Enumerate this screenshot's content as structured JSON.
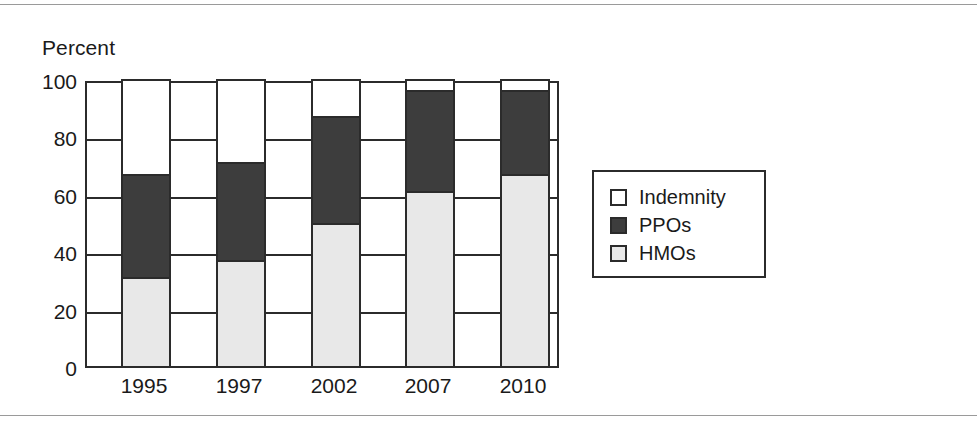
{
  "figure": {
    "axis_title": "Percent"
  },
  "chart_data": {
    "type": "bar",
    "subtype": "stacked-bar-100",
    "title": "",
    "xlabel": "",
    "ylabel": "Percent",
    "ylim": [
      0,
      100
    ],
    "yticks": [
      0,
      20,
      40,
      60,
      80,
      100
    ],
    "ytick_labels": [
      "0",
      "20",
      "40",
      "60",
      "80",
      "100"
    ],
    "grid": true,
    "grid_axis": "y",
    "legend_position": "right",
    "categories": [
      "1995",
      "1997",
      "2002",
      "2007",
      "2010"
    ],
    "series": [
      {
        "name": "HMOs",
        "color": "#e8e8e8",
        "values": [
          31,
          37,
          50,
          61,
          67
        ]
      },
      {
        "name": "PPOs",
        "color": "#3d3d3d",
        "values": [
          36,
          34,
          37,
          35,
          29
        ]
      },
      {
        "name": "Indemnity",
        "color": "#ffffff",
        "values": [
          33,
          29,
          13,
          4,
          4
        ]
      }
    ],
    "cumulative_tops": {
      "hmo": [
        31,
        37,
        50,
        61,
        67
      ],
      "ppo": [
        67,
        71,
        87,
        96,
        96
      ],
      "indemnity": [
        100,
        100,
        100,
        100,
        100
      ]
    }
  },
  "legend": {
    "entries": [
      {
        "label": "Indemnity",
        "swatch": "#ffffff",
        "name": "legend-swatch-indemnity"
      },
      {
        "label": "PPOs",
        "swatch": "#3d3d3d",
        "name": "legend-swatch-ppos"
      },
      {
        "label": "HMOs",
        "swatch": "#e8e8e8",
        "name": "legend-swatch-hmos"
      }
    ]
  },
  "colors": {
    "hmo": "#e8e8e8",
    "ppo": "#3d3d3d",
    "indemnity": "#ffffff",
    "ink": "#2b2b2b",
    "text": "#1a1a1a",
    "rule": "#9a9a9a"
  }
}
